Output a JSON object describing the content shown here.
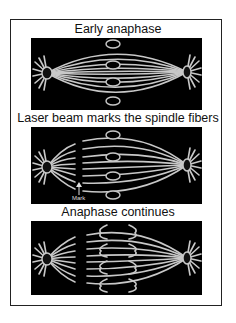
{
  "figure": {
    "panels": [
      {
        "title": "Early anaphase"
      },
      {
        "title": "Laser beam marks the spindle fibers",
        "annotation": "Mark"
      },
      {
        "title": "Anaphase continues"
      }
    ]
  },
  "colors": {
    "background": "#000000",
    "fiber": "#c8c8c8",
    "frame": "#222222"
  }
}
